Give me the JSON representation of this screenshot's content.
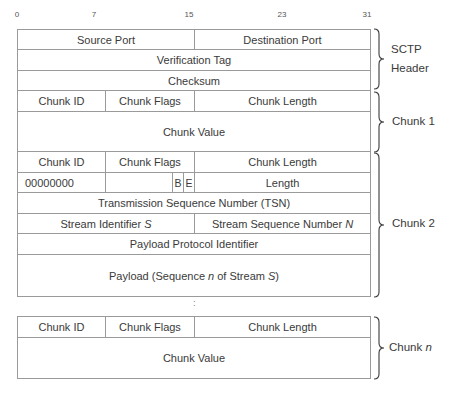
{
  "bit_ticks": [
    {
      "label": "0",
      "x": 17
    },
    {
      "label": "7",
      "x": 94
    },
    {
      "label": "15",
      "x": 189
    },
    {
      "label": "23",
      "x": 282
    },
    {
      "label": "31",
      "x": 367
    }
  ],
  "sctp_header": {
    "source_port": "Source Port",
    "destination_port": "Destination Port",
    "verification_tag": "Verification Tag",
    "checksum": "Checksum",
    "label_line1": "SCTP",
    "label_line2": "Header"
  },
  "chunk1": {
    "chunk_id": "Chunk ID",
    "chunk_flags": "Chunk Flags",
    "chunk_length": "Chunk Length",
    "chunk_value": "Chunk Value",
    "label": "Chunk 1"
  },
  "chunk2": {
    "chunk_id": "Chunk ID",
    "chunk_flags": "Chunk Flags",
    "chunk_length": "Chunk Length",
    "type_value": "00000000",
    "flag_b": "B",
    "flag_e": "E",
    "length": "Length",
    "tsn": "Transmission Sequence Number (TSN)",
    "stream_id_prefix": "Stream Identifier ",
    "stream_id_var": "S",
    "stream_seq_prefix": "Stream Sequence Number ",
    "stream_seq_var": "N",
    "payload_protocol": "Payload Protocol Identifier",
    "payload_prefix": "Payload (Sequence ",
    "payload_var_n": "n",
    "payload_mid": " of Stream ",
    "payload_var_s": "S",
    "payload_suffix": ")",
    "label": "Chunk 2"
  },
  "ellipsis": ":",
  "chunkn": {
    "chunk_id": "Chunk ID",
    "chunk_flags": "Chunk Flags",
    "chunk_length": "Chunk Length",
    "chunk_value": "Chunk Value",
    "label_prefix": "Chunk ",
    "label_var": "n"
  }
}
